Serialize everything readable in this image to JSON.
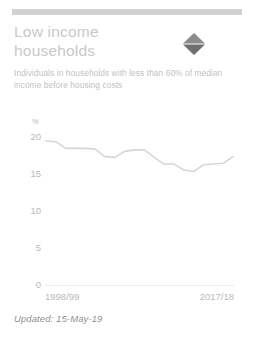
{
  "card": {
    "accent_color": "#d2d2d2",
    "background_color": "#ffffff"
  },
  "header": {
    "title": "Low income households",
    "subtitle": "Individuals in households with less than 60% of median income before housing costs"
  },
  "indicator": {
    "name": "diamond-indicator-icon",
    "top_color": "#8c8c8c",
    "bottom_color": "#6f6f6f"
  },
  "footer": {
    "updated_label": "Updated: 15-May-19"
  },
  "chart_data": {
    "type": "line",
    "title": "Low income households",
    "xlabel": "",
    "ylabel": "%",
    "ylim": [
      0,
      20
    ],
    "yticks": [
      0,
      5,
      10,
      15,
      20
    ],
    "ytick_labels": [
      "0",
      "5",
      "10",
      "15",
      "20"
    ],
    "grid": false,
    "legend": "none",
    "line_color": "#d6d6d6",
    "x_axis_start_label": "1998/99",
    "x_axis_end_label": "2017/18",
    "categories": [
      "1998/99",
      "1999/00",
      "2000/01",
      "2001/02",
      "2002/03",
      "2003/04",
      "2004/05",
      "2005/06",
      "2006/07",
      "2007/08",
      "2008/09",
      "2009/10",
      "2010/11",
      "2011/12",
      "2012/13",
      "2013/14",
      "2014/15",
      "2015/16",
      "2016/17",
      "2017/18"
    ],
    "values": [
      19.4,
      19.3,
      18.4,
      18.4,
      18.4,
      18.3,
      17.3,
      17.2,
      18.0,
      18.2,
      18.2,
      17.2,
      16.3,
      16.3,
      15.5,
      15.3,
      16.2,
      16.3,
      16.4,
      17.3
    ]
  }
}
